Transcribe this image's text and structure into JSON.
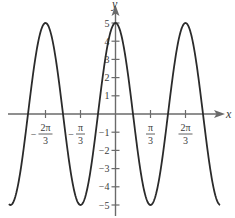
{
  "chart_data": {
    "type": "line",
    "title": "",
    "function": "y = 5 cos(3x)",
    "xlabel": "x",
    "ylabel": "y",
    "xlim": [
      -3.19,
      3.13
    ],
    "ylim": [
      -5.6,
      5.6
    ],
    "grid": false,
    "legend": null,
    "x_ticks": [
      {
        "value": -2.0944,
        "label_num": "2π",
        "label_den": "3",
        "sign": "−"
      },
      {
        "value": -1.0472,
        "label_num": "π",
        "label_den": "3",
        "sign": "−"
      },
      {
        "value": 1.0472,
        "label_num": "π",
        "label_den": "3",
        "sign": ""
      },
      {
        "value": 2.0944,
        "label_num": "2π",
        "label_den": "3",
        "sign": ""
      }
    ],
    "y_ticks": [
      {
        "value": 5,
        "label": "5"
      },
      {
        "value": 4,
        "label": "4"
      },
      {
        "value": 3,
        "label": "3"
      },
      {
        "value": 2,
        "label": "2"
      },
      {
        "value": 1,
        "label": "1"
      },
      {
        "value": -1,
        "label": "−1"
      },
      {
        "value": -2,
        "label": "−2"
      },
      {
        "value": -3,
        "label": "−3"
      },
      {
        "value": -4,
        "label": "−4"
      },
      {
        "value": -5,
        "label": "−5"
      }
    ],
    "series": [
      {
        "name": "5cos(3x)",
        "amplitude": 5,
        "frequency": 3,
        "key_points": [
          {
            "x": -2.0944,
            "y": 5
          },
          {
            "x": -1.0472,
            "y": -5
          },
          {
            "x": 0,
            "y": 5
          },
          {
            "x": 1.0472,
            "y": -5
          },
          {
            "x": 2.0944,
            "y": 5
          }
        ]
      }
    ]
  },
  "colors": {
    "curve": "#2b2b2b",
    "axis": "#6a6a6a",
    "label": "#3a3a3a"
  }
}
